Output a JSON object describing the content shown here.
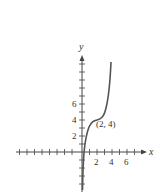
{
  "figure": {
    "type": "function-graph",
    "axes": {
      "x_label": "x",
      "y_label": "y",
      "x_ticks_labeled": [
        "2",
        "4",
        "6"
      ],
      "y_ticks_labeled": [
        "2",
        "4",
        "6"
      ]
    },
    "annotation": {
      "text": "(2, 4)",
      "point": [
        2,
        4
      ]
    },
    "curve": {
      "description": "increasing curve with horizontal inflection at (2, 4), steep near x=0 and x=4",
      "color": "#555555"
    }
  }
}
